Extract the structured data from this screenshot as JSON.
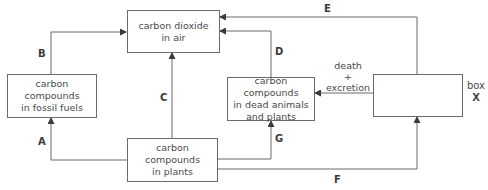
{
  "boxes": {
    "co2": {
      "line1": "carbon dioxide",
      "line2": "in air"
    },
    "fossil": {
      "line1": "carbon compounds",
      "line2": "in fossil fuels"
    },
    "dead": {
      "line1": "carbon compounds",
      "line2": "in dead animals",
      "line3": "and plants"
    },
    "plants": {
      "line1": "carbon compounds",
      "line2": "in plants"
    },
    "x": {
      "label_line1": "box",
      "label_line2": "X"
    }
  },
  "arrows": {
    "A": "A",
    "B": "B",
    "C": "C",
    "D": "D",
    "E": "E",
    "F": "F",
    "G": "G"
  },
  "death_note": {
    "line1": "death",
    "line2": "+",
    "line3": "excretion"
  },
  "colors": {
    "line": "#6a6a6a",
    "text": "#4a4a4a"
  }
}
